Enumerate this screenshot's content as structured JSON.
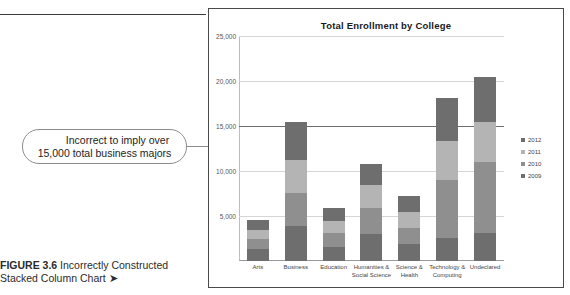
{
  "figure": {
    "caption_bold": "FIGURE 3.6",
    "caption_rest": " Incorrectly Constructed Stacked Column Chart",
    "caption_arrow": "➤"
  },
  "callout": {
    "line1": "Incorrect to imply over",
    "line2": "15,000 total business majors"
  },
  "chart_data": {
    "type": "bar",
    "subtype": "stacked-column",
    "title": "Total Enrollment by College",
    "xlabel": "",
    "ylabel": "",
    "ylim": [
      0,
      25000
    ],
    "ytick_labels": [
      "25,000",
      "20,000",
      "15,000",
      "10,000",
      "5,000"
    ],
    "ytick_values": [
      25000,
      20000,
      15000,
      10000,
      5000
    ],
    "grid": true,
    "legend_position": "right",
    "emphasized_gridline": 15000,
    "categories": [
      "Arts",
      "Business",
      "Education",
      "Humanities & Social Science",
      "Science & Health",
      "Technology & Computing",
      "Undeclared"
    ],
    "category_lines": [
      [
        "Arts"
      ],
      [
        "Business"
      ],
      [
        "Education"
      ],
      [
        "Humanities &",
        "Social Science"
      ],
      [
        "Science &",
        "Health"
      ],
      [
        "Technology &",
        "Computing"
      ],
      [
        "Undeclared"
      ]
    ],
    "series": [
      {
        "name": "2009",
        "color": "#6e6e6e",
        "values": [
          1300,
          3900,
          1600,
          3000,
          1900,
          2500,
          3100
        ]
      },
      {
        "name": "2010",
        "color": "#8f8f8f",
        "values": [
          1100,
          3700,
          1500,
          2900,
          1800,
          6500,
          7900
        ]
      },
      {
        "name": "2011",
        "color": "#b4b4b4",
        "values": [
          1050,
          3600,
          1400,
          2500,
          1750,
          4300,
          4500
        ]
      },
      {
        "name": "2012",
        "color": "#6e6e6e",
        "values": [
          1150,
          4300,
          1400,
          2400,
          1750,
          4800,
          5000
        ]
      }
    ],
    "totals": [
      4600,
      15500,
      5900,
      10800,
      7200,
      18100,
      20500
    ],
    "legend_entries": [
      {
        "label": "2012",
        "color": "#6e6e6e"
      },
      {
        "label": "2011",
        "color": "#b4b4b4"
      },
      {
        "label": "2010",
        "color": "#8f8f8f"
      },
      {
        "label": "2009",
        "color": "#6e6e6e"
      }
    ]
  }
}
